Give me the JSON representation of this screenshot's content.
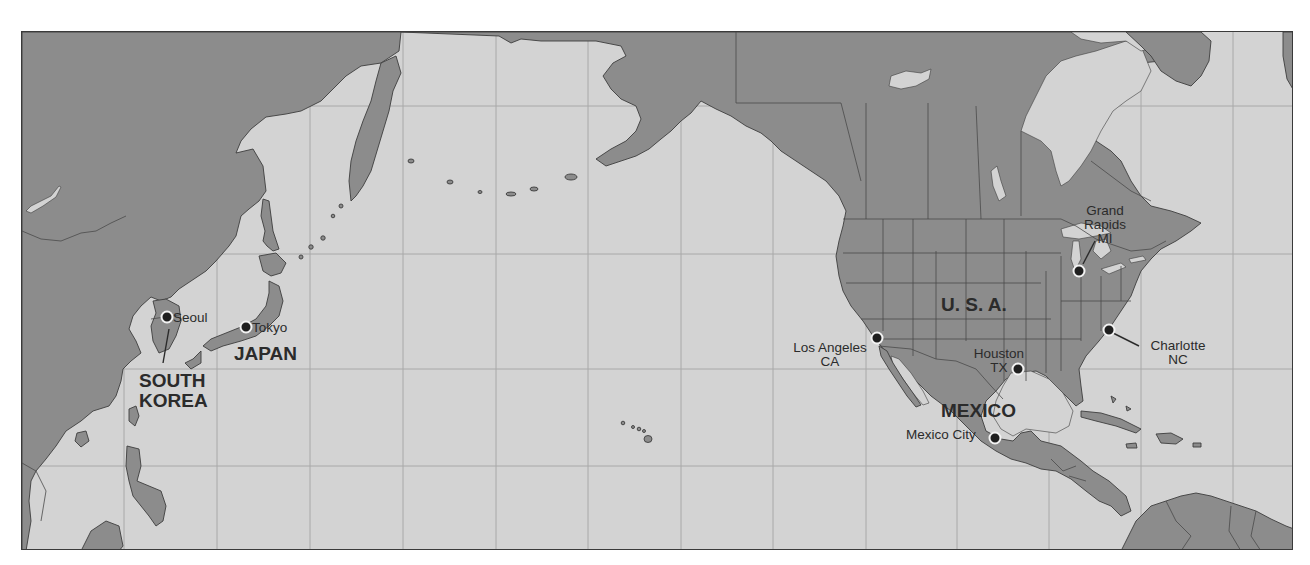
{
  "map": {
    "colors": {
      "land": "#8c8c8c",
      "water": "#d3d3d3",
      "grid": "#a8a8a8",
      "outline": "#3d3d3d",
      "text": "#2b2b2b",
      "marker": "#1f1f1f"
    },
    "countries": [
      {
        "id": "south-korea",
        "line1": "SOUTH",
        "line2": "KOREA"
      },
      {
        "id": "japan",
        "label": "JAPAN"
      },
      {
        "id": "usa",
        "label": "U. S. A."
      },
      {
        "id": "mexico",
        "label": "MEXICO"
      }
    ],
    "cities": [
      {
        "id": "seoul",
        "label": "Seoul"
      },
      {
        "id": "tokyo",
        "label": "Tokyo"
      },
      {
        "id": "los-angeles",
        "line1": "Los Angeles",
        "line2": "CA"
      },
      {
        "id": "houston",
        "line1": "Houston",
        "line2": "TX"
      },
      {
        "id": "mexico-city",
        "label": "Mexico City"
      },
      {
        "id": "grand-rapids",
        "line1": "Grand",
        "line2": "Rapids",
        "line3": "MI"
      },
      {
        "id": "charlotte",
        "line1": "Charlotte",
        "line2": "NC"
      }
    ]
  }
}
